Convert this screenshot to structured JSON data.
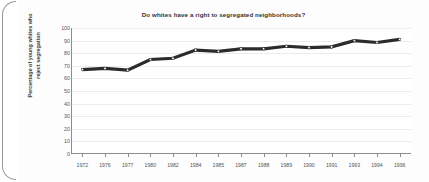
{
  "chart_data": {
    "type": "line",
    "title": "Do whites have a right to segregated neighborhoods?",
    "xlabel": "",
    "ylabel": "Percentage of young whites who reject segregation",
    "ylabel_line1": "Percentage of young whites who",
    "ylabel_line2": "reject segregation",
    "categories": [
      "1972",
      "1976",
      "1977",
      "1980",
      "1982",
      "1984",
      "1985",
      "1987",
      "1988",
      "1989",
      "1990",
      "1991",
      "1993",
      "1994",
      "1996"
    ],
    "values": [
      67,
      68,
      66.5,
      75,
      76,
      82.5,
      81.5,
      83.5,
      83.5,
      85.5,
      84.5,
      85,
      90,
      88.5,
      91
    ],
    "series": [
      {
        "name": "Percentage of young whites who reject segregation",
        "values": [
          67,
          68,
          66.5,
          75,
          76,
          82.5,
          81.5,
          83.5,
          83.5,
          85.5,
          84.5,
          85,
          90,
          88.5,
          91
        ]
      }
    ],
    "ylim": [
      0,
      100
    ],
    "ytick_labels": [
      "0",
      "10",
      "20",
      "30",
      "40",
      "50",
      "60",
      "70",
      "80",
      "90",
      "100"
    ],
    "ytick_values": [
      0,
      10,
      20,
      30,
      40,
      50,
      60,
      70,
      80,
      90,
      100
    ],
    "grid": true,
    "legend": "none",
    "line_color": "#2b2b2b",
    "marker_color": "#ffffff",
    "grid_color": "#ececec",
    "axis_color": "#8d8d8d",
    "background_color": "#ffffff"
  }
}
